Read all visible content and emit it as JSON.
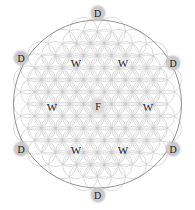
{
  "canvas": {
    "width": 195,
    "height": 210,
    "background": "#ffffff"
  },
  "figure": {
    "kind": "flower-of-life-geometry",
    "outer_circle": {
      "cx": 97.5,
      "cy": 104,
      "r": 84,
      "stroke": "#888888"
    },
    "lattice": {
      "cell_radius": 14,
      "grid_stroke": "#c4c4c4",
      "circle_stroke": "#bdbdbd",
      "spoke_stroke": "#cccccc"
    }
  },
  "nodes": [
    {
      "id": "d-top",
      "label": "D",
      "style": "badge",
      "x": 97.5,
      "y": 13
    },
    {
      "id": "d-upper-left",
      "label": "D",
      "style": "badge",
      "x": 21,
      "y": 58
    },
    {
      "id": "d-upper-right",
      "label": "D",
      "style": "badge",
      "x": 173,
      "y": 63
    },
    {
      "id": "d-lower-left",
      "label": "D",
      "style": "badge",
      "x": 21,
      "y": 149
    },
    {
      "id": "d-lower-right",
      "label": "D",
      "style": "badge",
      "x": 173,
      "y": 149
    },
    {
      "id": "d-bottom",
      "label": "D",
      "style": "badge",
      "x": 97.5,
      "y": 195
    },
    {
      "id": "w-upper-left",
      "label": "W",
      "style": "plain",
      "x": 76,
      "y": 63
    },
    {
      "id": "w-upper-right",
      "label": "W",
      "style": "plain",
      "x": 123,
      "y": 63
    },
    {
      "id": "w-mid-left",
      "label": "W",
      "style": "plain",
      "x": 52,
      "y": 107
    },
    {
      "id": "w-mid-right",
      "label": "W",
      "style": "plain",
      "x": 148,
      "y": 107
    },
    {
      "id": "w-lower-left",
      "label": "W",
      "style": "plain",
      "x": 76,
      "y": 150
    },
    {
      "id": "w-lower-right",
      "label": "W",
      "style": "plain",
      "x": 123,
      "y": 150
    },
    {
      "id": "f-center",
      "label": "F",
      "style": "badge center-badge",
      "x": 98,
      "y": 106
    }
  ]
}
